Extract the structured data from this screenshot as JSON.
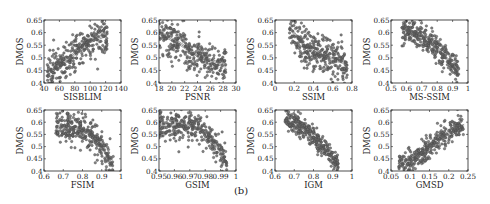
{
  "figure": {
    "panel_label": "(b)",
    "point_color": "#6e6e6e",
    "point_edge": "#3c3c3c",
    "line_color": "#555555"
  },
  "chart_data": [
    {
      "type": "scatter",
      "title": "",
      "xlabel": "SISBLIM",
      "ylabel": "DMOS",
      "xlim": [
        40,
        140
      ],
      "ylim": [
        0.4,
        0.65
      ],
      "xticks": [
        40,
        60,
        80,
        100,
        120,
        140
      ],
      "xtick_labels": [
        "40",
        "60",
        "80",
        "100",
        "120",
        "140"
      ],
      "yticks": [
        0.4,
        0.45,
        0.5,
        0.55,
        0.6,
        0.65
      ],
      "ytick_labels": [
        "0.4",
        "0.45",
        "0.5",
        "0.55",
        "0.6",
        "0.65"
      ],
      "grid": false,
      "trend": {
        "shape": "increasing",
        "x_range": [
          44,
          122
        ],
        "fit_points": [
          [
            45,
            0.44
          ],
          [
            70,
            0.49
          ],
          [
            95,
            0.56
          ],
          [
            120,
            0.59
          ]
        ]
      },
      "spread": 0.035,
      "n_points": 300,
      "frame": {
        "left": 44,
        "top": 20,
        "right": 121,
        "bottom": 83
      }
    },
    {
      "type": "scatter",
      "title": "",
      "xlabel": "PSNR",
      "ylabel": "DMOS",
      "xlim": [
        18,
        30
      ],
      "ylim": [
        0.4,
        0.65
      ],
      "xticks": [
        18,
        20,
        22,
        24,
        26,
        28,
        30
      ],
      "xtick_labels": [
        "18",
        "20",
        "22",
        "24",
        "26",
        "28",
        "30"
      ],
      "yticks": [
        0.4,
        0.45,
        0.5,
        0.55,
        0.6,
        0.65
      ],
      "ytick_labels": [
        "0.4",
        "0.45",
        "0.5",
        "0.55",
        "0.6",
        "0.65"
      ],
      "grid": false,
      "trend": {
        "shape": "decreasing",
        "x_range": [
          18,
          28.5
        ],
        "fit_points": [
          [
            18,
            0.6
          ],
          [
            21,
            0.56
          ],
          [
            24,
            0.51
          ],
          [
            28,
            0.47
          ]
        ]
      },
      "spread": 0.04,
      "n_points": 300,
      "frame": {
        "left": 159,
        "top": 20,
        "right": 236,
        "bottom": 83
      }
    },
    {
      "type": "scatter",
      "title": "",
      "xlabel": "SSIM",
      "ylabel": "DMOS",
      "xlim": [
        0,
        0.8
      ],
      "ylim": [
        0.4,
        0.65
      ],
      "xticks": [
        0,
        0.2,
        0.4,
        0.6,
        0.8
      ],
      "xtick_labels": [
        "0",
        "0.2",
        "0.4",
        "0.6",
        "0.8"
      ],
      "yticks": [
        0.4,
        0.45,
        0.5,
        0.55,
        0.6,
        0.65
      ],
      "ytick_labels": [
        "0.4",
        "0.45",
        "0.5",
        "0.55",
        "0.6",
        "0.65"
      ],
      "grid": false,
      "trend": {
        "shape": "decreasing",
        "x_range": [
          0.15,
          0.75
        ],
        "fit_points": [
          [
            0.15,
            0.62
          ],
          [
            0.3,
            0.55
          ],
          [
            0.45,
            0.51
          ],
          [
            0.75,
            0.48
          ]
        ]
      },
      "spread": 0.04,
      "n_points": 300,
      "frame": {
        "left": 275,
        "top": 20,
        "right": 352,
        "bottom": 83
      }
    },
    {
      "type": "scatter",
      "title": "",
      "xlabel": "MS-SSIM",
      "ylabel": "DMOS",
      "xlim": [
        0.5,
        1
      ],
      "ylim": [
        0.4,
        0.65
      ],
      "xticks": [
        0.5,
        0.6,
        0.7,
        0.8,
        0.9,
        1
      ],
      "xtick_labels": [
        "0.5",
        "0.6",
        "0.7",
        "0.8",
        "0.9",
        "1"
      ],
      "yticks": [
        0.4,
        0.45,
        0.5,
        0.55,
        0.6,
        0.65
      ],
      "ytick_labels": [
        "0.4",
        "0.45",
        "0.5",
        "0.55",
        "0.6",
        "0.65"
      ],
      "grid": false,
      "trend": {
        "shape": "decreasing",
        "x_range": [
          0.57,
          0.94
        ],
        "fit_points": [
          [
            0.57,
            0.615
          ],
          [
            0.7,
            0.59
          ],
          [
            0.8,
            0.54
          ],
          [
            0.9,
            0.47
          ],
          [
            0.94,
            0.43
          ]
        ]
      },
      "spread": 0.028,
      "n_points": 300,
      "frame": {
        "left": 391,
        "top": 20,
        "right": 468,
        "bottom": 83
      }
    },
    {
      "type": "scatter",
      "title": "",
      "xlabel": "FSIM",
      "ylabel": "DMOS",
      "xlim": [
        0.6,
        1
      ],
      "ylim": [
        0.4,
        0.65
      ],
      "xticks": [
        0.6,
        0.7,
        0.8,
        0.9,
        1
      ],
      "xtick_labels": [
        "0.6",
        "0.7",
        "0.8",
        "0.9",
        "1"
      ],
      "yticks": [
        0.4,
        0.45,
        0.5,
        0.55,
        0.6,
        0.65
      ],
      "ytick_labels": [
        "0.4",
        "0.45",
        "0.5",
        "0.55",
        "0.6",
        "0.65"
      ],
      "grid": false,
      "trend": {
        "shape": "decreasing",
        "x_range": [
          0.66,
          0.96
        ],
        "fit_points": [
          [
            0.66,
            0.58
          ],
          [
            0.78,
            0.575
          ],
          [
            0.85,
            0.55
          ],
          [
            0.9,
            0.5
          ],
          [
            0.95,
            0.43
          ]
        ]
      },
      "spread": 0.03,
      "n_points": 300,
      "frame": {
        "left": 44,
        "top": 110,
        "right": 121,
        "bottom": 171
      }
    },
    {
      "type": "scatter",
      "title": "",
      "xlabel": "GSIM",
      "ylabel": "DMOS",
      "xlim": [
        0.95,
        1
      ],
      "ylim": [
        0.4,
        0.65
      ],
      "xticks": [
        0.95,
        0.96,
        0.97,
        0.98,
        0.99,
        1
      ],
      "xtick_labels": [
        "0.95",
        "0.96",
        "0.97",
        "0.98",
        "0.99",
        "1"
      ],
      "yticks": [
        0.4,
        0.45,
        0.5,
        0.55,
        0.6,
        0.65
      ],
      "ytick_labels": [
        "0.4",
        "0.45",
        "0.5",
        "0.55",
        "0.6",
        "0.65"
      ],
      "grid": false,
      "trend": {
        "shape": "decreasing",
        "x_range": [
          0.95,
          0.994
        ],
        "fit_points": [
          [
            0.95,
            0.59
          ],
          [
            0.97,
            0.585
          ],
          [
            0.98,
            0.56
          ],
          [
            0.988,
            0.5
          ],
          [
            0.994,
            0.43
          ]
        ]
      },
      "spread": 0.03,
      "n_points": 300,
      "frame": {
        "left": 159,
        "top": 110,
        "right": 236,
        "bottom": 171
      }
    },
    {
      "type": "scatter",
      "title": "",
      "xlabel": "IGM",
      "ylabel": "DMOS",
      "xlim": [
        0.6,
        1
      ],
      "ylim": [
        0.4,
        0.65
      ],
      "xticks": [
        0.6,
        0.7,
        0.8,
        0.9,
        1
      ],
      "xtick_labels": [
        "0.6",
        "0.7",
        "0.8",
        "0.9",
        "1"
      ],
      "yticks": [
        0.4,
        0.45,
        0.5,
        0.55,
        0.6,
        0.65
      ],
      "ytick_labels": [
        "0.4",
        "0.45",
        "0.5",
        "0.55",
        "0.6",
        "0.65"
      ],
      "grid": false,
      "trend": {
        "shape": "decreasing",
        "x_range": [
          0.65,
          0.93
        ],
        "fit_points": [
          [
            0.65,
            0.605
          ],
          [
            0.72,
            0.59
          ],
          [
            0.8,
            0.54
          ],
          [
            0.87,
            0.48
          ],
          [
            0.92,
            0.43
          ]
        ]
      },
      "spread": 0.022,
      "n_points": 300,
      "frame": {
        "left": 275,
        "top": 110,
        "right": 352,
        "bottom": 171
      }
    },
    {
      "type": "scatter",
      "title": "",
      "xlabel": "GMSD",
      "ylabel": "DMOS",
      "xlim": [
        0.05,
        0.25
      ],
      "ylim": [
        0.4,
        0.65
      ],
      "xticks": [
        0.05,
        0.1,
        0.15,
        0.2,
        0.25
      ],
      "xtick_labels": [
        "0.05",
        "0.1",
        "0.15",
        "0.2",
        "0.25"
      ],
      "yticks": [
        0.4,
        0.45,
        0.5,
        0.55,
        0.6,
        0.65
      ],
      "ytick_labels": [
        "0.4",
        "0.45",
        "0.5",
        "0.55",
        "0.6",
        "0.65"
      ],
      "grid": false,
      "trend": {
        "shape": "increasing",
        "x_range": [
          0.07,
          0.24
        ],
        "fit_points": [
          [
            0.07,
            0.42
          ],
          [
            0.12,
            0.46
          ],
          [
            0.17,
            0.53
          ],
          [
            0.22,
            0.575
          ],
          [
            0.24,
            0.585
          ]
        ]
      },
      "spread": 0.025,
      "n_points": 300,
      "frame": {
        "left": 391,
        "top": 110,
        "right": 468,
        "bottom": 171
      }
    }
  ]
}
